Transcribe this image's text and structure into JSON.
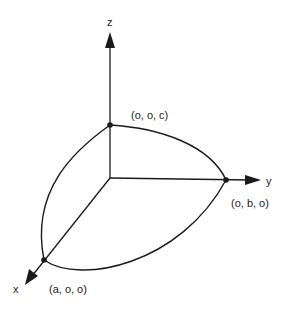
{
  "diagram": {
    "type": "ellipsoid-octant",
    "axes": {
      "x": {
        "label": "x"
      },
      "y": {
        "label": "y"
      },
      "z": {
        "label": "z"
      }
    },
    "points": {
      "x_intercept": {
        "label": "(a, o, o)"
      },
      "y_intercept": {
        "label": "(o, b, o)"
      },
      "z_intercept": {
        "label": "(o, o, c)"
      }
    },
    "colors": {
      "ink": "#1a1a1a",
      "background": "#ffffff"
    }
  }
}
